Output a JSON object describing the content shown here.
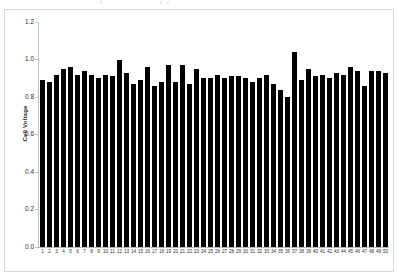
{
  "chart_data": {
    "type": "bar",
    "title": "",
    "xlabel": "",
    "ylabel": "Cell Voltage",
    "ylim": [
      0.0,
      1.2
    ],
    "yticks": [
      "0.0",
      "0.2",
      "0.4",
      "0.6",
      "0.8",
      "1.0",
      "1.2"
    ],
    "grid": false,
    "legend": null,
    "bar_color": "#000000",
    "categories": [
      "1",
      "2",
      "3",
      "4",
      "5",
      "6",
      "7",
      "8",
      "9",
      "10",
      "11",
      "12",
      "13",
      "14",
      "15",
      "16",
      "17",
      "18",
      "19",
      "20",
      "21",
      "22",
      "23",
      "24",
      "25",
      "26",
      "27",
      "28",
      "29",
      "30",
      "31",
      "32",
      "33",
      "34",
      "35",
      "36",
      "37",
      "38",
      "39",
      "40",
      "41",
      "42",
      "43",
      "44",
      "45",
      "46",
      "47",
      "48",
      "49",
      "50"
    ],
    "values": [
      0.89,
      0.88,
      0.92,
      0.95,
      0.96,
      0.92,
      0.94,
      0.92,
      0.9,
      0.92,
      0.91,
      1.0,
      0.93,
      0.87,
      0.89,
      0.96,
      0.86,
      0.88,
      0.97,
      0.88,
      0.97,
      0.87,
      0.95,
      0.9,
      0.9,
      0.92,
      0.9,
      0.91,
      0.91,
      0.9,
      0.88,
      0.9,
      0.92,
      0.87,
      0.84,
      0.8,
      1.04,
      0.89,
      0.95,
      0.91,
      0.92,
      0.9,
      0.93,
      0.92,
      0.96,
      0.94,
      0.86,
      0.94,
      0.94,
      0.93
    ]
  }
}
